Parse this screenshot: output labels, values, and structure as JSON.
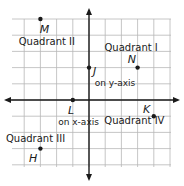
{
  "diagram": {
    "type": "coordinate-plane",
    "x_range": [
      -5,
      5
    ],
    "y_range": [
      -4,
      5
    ],
    "grid": true,
    "colors": {
      "grid": "#b8b8b8",
      "axis": "#1a1a1a",
      "text": "#1a1a1a"
    },
    "quadrant_labels": [
      {
        "id": "q2",
        "text": "Quadrant II",
        "x": -2.6,
        "y": 3.4
      },
      {
        "id": "q1",
        "text": "Quadrant I",
        "x": 2.6,
        "y": 3.0
      },
      {
        "id": "q4",
        "text": "Quadrant IV",
        "x": 2.8,
        "y": -1.5
      },
      {
        "id": "q3",
        "text": "Quadrant III",
        "x": -3.3,
        "y": -2.6
      }
    ],
    "points": [
      {
        "name": "M",
        "x": -3,
        "y": 5,
        "label_dx": 0.25,
        "label_dy": -0.6
      },
      {
        "name": "N",
        "x": 3,
        "y": 2,
        "label_dx": -0.35,
        "label_dy": 0.55
      },
      {
        "name": "J",
        "x": 0,
        "y": 2,
        "label_dx": 0.35,
        "label_dy": -0.2,
        "note": "on y-axis",
        "note_dx": 0.35,
        "note_dy": -0.95
      },
      {
        "name": "L",
        "x": -1,
        "y": 0,
        "label_dx": -0.1,
        "label_dy": -0.6,
        "note": "on x-axis",
        "note_dx": -0.9,
        "note_dy": -1.35
      },
      {
        "name": "K",
        "x": 4,
        "y": -1,
        "label_dx": -0.45,
        "label_dy": 0.45
      },
      {
        "name": "H",
        "x": -3,
        "y": -3,
        "label_dx": -0.45,
        "label_dy": -0.6
      }
    ]
  }
}
